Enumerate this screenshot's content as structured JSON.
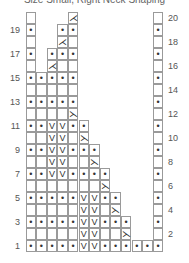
{
  "title": "Size Small, Right Neck Shaping",
  "legend_symbols": {
    "purl": "•",
    "slip": "V",
    "left_dec": "⋋",
    "right_dec": "⋌",
    "knit": ""
  },
  "row_numbers_left": [
    1,
    3,
    5,
    7,
    9,
    11,
    13,
    15,
    17,
    19
  ],
  "row_numbers_right": [
    2,
    4,
    6,
    8,
    10,
    12,
    14,
    16,
    18,
    20
  ],
  "grid": {
    "cols": 13,
    "rows": 20,
    "rows_data": {
      "1": {
        "cells": {
          "1": "•",
          "2": "•",
          "3": "•",
          "4": "•",
          "5": "•",
          "6": "V",
          "7": "V",
          "8": "•",
          "9": "•",
          "10": "•",
          "11": "•",
          "12": "•",
          "13": "•"
        }
      },
      "2": {
        "cells": {
          "1": "",
          "2": "",
          "3": "",
          "4": "",
          "5": "",
          "6": "V",
          "7": "V",
          "8": "",
          "9": "",
          "10": "⋋",
          "13": ""
        }
      },
      "3": {
        "cells": {
          "1": "•",
          "2": "•",
          "3": "•",
          "4": "•",
          "5": "•",
          "6": "V",
          "7": "V",
          "8": "•",
          "9": "•",
          "10": "•",
          "13": "•"
        }
      },
      "4": {
        "cells": {
          "1": "",
          "2": "",
          "3": "",
          "4": "",
          "5": "",
          "6": "V",
          "7": "V",
          "8": "",
          "9": "⋋",
          "13": ""
        }
      },
      "5": {
        "cells": {
          "1": "•",
          "2": "•",
          "3": "•",
          "4": "•",
          "5": "•",
          "6": "V",
          "7": "V",
          "8": "•",
          "9": "•",
          "13": "•"
        }
      },
      "6": {
        "cells": {
          "1": "",
          "2": "",
          "3": "",
          "4": "",
          "5": "",
          "6": "",
          "7": "",
          "8": "⋋",
          "13": ""
        }
      },
      "7": {
        "cells": {
          "1": "•",
          "2": "•",
          "3": "V",
          "4": "V",
          "5": "•",
          "6": "•",
          "7": "•",
          "8": "•",
          "13": "•"
        }
      },
      "8": {
        "cells": {
          "1": "",
          "2": "",
          "3": "V",
          "4": "V",
          "5": "",
          "6": "",
          "7": "⋋",
          "13": ""
        }
      },
      "9": {
        "cells": {
          "1": "•",
          "2": "•",
          "3": "V",
          "4": "V",
          "5": "•",
          "6": "•",
          "7": "•",
          "13": "•"
        }
      },
      "10": {
        "cells": {
          "1": "",
          "2": "",
          "3": "V",
          "4": "V",
          "5": "",
          "6": "⋋",
          "13": ""
        }
      },
      "11": {
        "cells": {
          "1": "•",
          "2": "•",
          "3": "V",
          "4": "V",
          "5": "•",
          "6": "•",
          "13": "•"
        }
      },
      "12": {
        "cells": {
          "1": "",
          "2": "",
          "3": "",
          "4": "",
          "5": "⋋",
          "13": ""
        }
      },
      "13": {
        "cells": {
          "1": "•",
          "2": "•",
          "3": "•",
          "4": "•",
          "5": "•",
          "13": "•"
        }
      },
      "14": {
        "cells": {
          "1": "",
          "2": "",
          "3": "",
          "4": "",
          "5": "",
          "13": ""
        }
      },
      "15": {
        "cells": {
          "1": "•",
          "2": "•",
          "3": "•",
          "4": "•",
          "5": "•",
          "13": "•"
        }
      },
      "16": {
        "cells": {
          "1": "",
          "3": "⋌",
          "4": "",
          "5": "",
          "13": ""
        }
      },
      "17": {
        "cells": {
          "1": "•",
          "3": "•",
          "4": "•",
          "5": "•",
          "13": "•"
        }
      },
      "18": {
        "cells": {
          "1": "",
          "4": "⋌",
          "5": "",
          "13": ""
        }
      },
      "19": {
        "cells": {
          "1": "•",
          "4": "•",
          "5": "•",
          "13": "•"
        }
      },
      "20": {
        "cells": {
          "1": "",
          "5": "⋌",
          "13": ""
        }
      }
    }
  }
}
